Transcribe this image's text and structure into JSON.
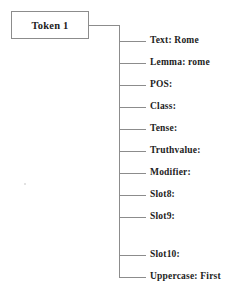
{
  "diagram": {
    "type": "token-attribute-tree",
    "root": {
      "label": "Token 1"
    },
    "branches": [
      {
        "label": "Text: Rome",
        "field": "Text",
        "value": "Rome",
        "y": 41
      },
      {
        "label": "Lemma: rome",
        "field": "Lemma",
        "value": "rome",
        "y": 63
      },
      {
        "label": "POS:",
        "field": "POS",
        "value": "",
        "y": 85
      },
      {
        "label": "Class:",
        "field": "Class",
        "value": "",
        "y": 107
      },
      {
        "label": "Tense:",
        "field": "Tense",
        "value": "",
        "y": 129
      },
      {
        "label": "Truthvalue:",
        "field": "Truthvalue",
        "value": "",
        "y": 151
      },
      {
        "label": "Modifier:",
        "field": "Modifier",
        "value": "",
        "y": 173
      },
      {
        "label": "Slot8:",
        "field": "Slot8",
        "value": "",
        "y": 195
      },
      {
        "label": "Slot9:",
        "field": "Slot9",
        "value": "",
        "y": 217
      },
      {
        "label": "Slot10:",
        "field": "Slot10",
        "value": "",
        "y": 255
      },
      {
        "label": "Uppercase: First",
        "field": "Uppercase",
        "value": "First",
        "y": 277
      }
    ],
    "colors": {
      "background": "#ffffff",
      "line": "#8c8c8c",
      "text": "#1d1d1d",
      "box_border": "#8c8c8c"
    }
  }
}
